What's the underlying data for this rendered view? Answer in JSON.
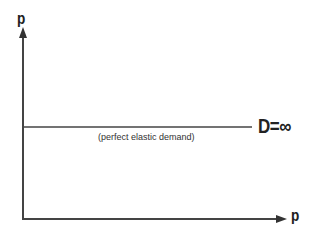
{
  "diagram": {
    "y_axis_label": "p",
    "x_axis_label": "p",
    "demand_label": "D=∞",
    "annotation": "(perfect elastic demand)",
    "colors": {
      "line": "#444444",
      "text": "#222222",
      "background": "#ffffff"
    }
  }
}
